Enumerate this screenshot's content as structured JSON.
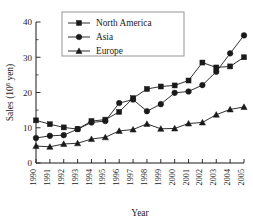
{
  "chart_data": {
    "type": "line",
    "title": "",
    "xlabel": "Year",
    "ylabel": "Sales (10⁸ yen)",
    "ylabel_base": "Sales (10",
    "ylabel_exp": "8",
    "ylabel_tail": " yen)",
    "categories": [
      "1990",
      "1991",
      "1992",
      "1993",
      "1994",
      "1995",
      "1996",
      "1997",
      "1998",
      "1999",
      "2000",
      "2001",
      "2002",
      "2003",
      "2004",
      "2005"
    ],
    "x": [
      1990,
      1991,
      1992,
      1993,
      1994,
      1995,
      1996,
      1997,
      1998,
      1999,
      2000,
      2001,
      2002,
      2003,
      2004,
      2005
    ],
    "xlim": [
      1989.5,
      2005.5
    ],
    "ylim": [
      0,
      40
    ],
    "yticks": [
      0,
      10,
      20,
      30,
      40
    ],
    "ytick_labels": [
      "0",
      "10",
      "20",
      "30",
      "40"
    ],
    "yminor_step": 5,
    "grid": false,
    "legend_position": "top-left",
    "series": [
      {
        "name": "North America",
        "marker": "square",
        "values": [
          12.1,
          11.0,
          10.1,
          9.6,
          11.9,
          12.3,
          14.5,
          18.4,
          21.0,
          21.7,
          22.0,
          23.4,
          28.5,
          27.1,
          27.4,
          30.0
        ]
      },
      {
        "name": "Asia",
        "marker": "circle",
        "values": [
          7.1,
          7.7,
          7.9,
          9.6,
          11.5,
          11.9,
          17.0,
          18.0,
          14.7,
          16.7,
          19.9,
          20.3,
          22.1,
          25.9,
          31.1,
          36.2
        ]
      },
      {
        "name": "Europe",
        "marker": "triangle",
        "values": [
          4.8,
          4.6,
          5.4,
          5.6,
          6.8,
          7.3,
          9.1,
          9.5,
          11.1,
          9.7,
          9.8,
          11.2,
          11.5,
          13.7,
          15.2,
          15.9
        ]
      }
    ]
  }
}
